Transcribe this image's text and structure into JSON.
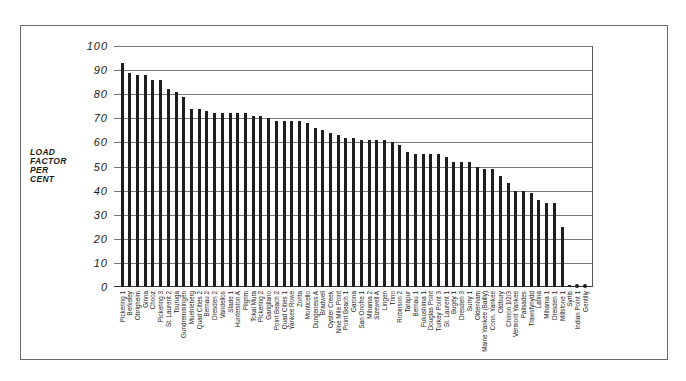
{
  "chart_data": {
    "type": "bar",
    "title": "",
    "xlabel": "",
    "ylabel": "LOAD FACTOR PER CENT",
    "ylabel_lines": [
      "LOAD",
      "FACTOR",
      "PER",
      "CENT"
    ],
    "ylim": [
      0,
      100
    ],
    "yticks": [
      0,
      10,
      20,
      30,
      40,
      50,
      60,
      70,
      80,
      90,
      100
    ],
    "grid": "horizontal",
    "legend": "none",
    "categories": [
      "Pickering 1",
      "Berkeley",
      "Obrigheim",
      "Ginna",
      "Chooz",
      "Pickering 3",
      "St. Laurent 2",
      "Tsuruga",
      "Gundremmingen",
      "Muehleberg",
      "Quad Cities 2",
      "Bernau 2",
      "Dresden 2",
      "Vandellos",
      "Stade 1",
      "Hunterston A",
      "Pilgrim",
      "Tokai Mura",
      "Pickering 2",
      "Garigliano",
      "Point Beach 2",
      "Quad Cities 1",
      "Yankee Rowe",
      "Zorita",
      "Monticello",
      "Dungeness A",
      "Bradwell",
      "Oyster Creek",
      "Nine Mile Point",
      "Point Beach 1",
      "Garona",
      "San Onofre 1",
      "Mihama 2",
      "Sizewell A",
      "Lingen",
      "Trino",
      "Robinson 2",
      "Tarapur",
      "Bernau 1",
      "Fukushima 1",
      "Douglas Point",
      "Turkey Point 3",
      "St. Laurent 1",
      "Bugey 1",
      "Dresden 3",
      "Surry 1",
      "Oldenham",
      "Maine Yankee (Bailly)",
      "Conn. Yankee",
      "Oldbury",
      "Chinon 1/2/3",
      "Vermont Yankee",
      "Palisades",
      "Trawsfynydd",
      "Latina",
      "Mihama 1",
      "Dresden 1",
      "Millstone 1",
      "Syrtis",
      "Indian Point 1",
      "Gentilly"
    ],
    "values": [
      93,
      89,
      88,
      88,
      86,
      86,
      82,
      81,
      79,
      74,
      74,
      73,
      72,
      72,
      72,
      72,
      72,
      71,
      71,
      70,
      69,
      69,
      69,
      69,
      68,
      66,
      65,
      64,
      63,
      62,
      62,
      61,
      61,
      61,
      61,
      60,
      59,
      56,
      55,
      55,
      55,
      55,
      54,
      52,
      52,
      52,
      50,
      49,
      49,
      46,
      43,
      40,
      40,
      39,
      36,
      35,
      35,
      25,
      1,
      1,
      1
    ],
    "markers": {
      "near_zero_dots": [
        "Indian Point 1",
        "Gentilly"
      ]
    }
  }
}
